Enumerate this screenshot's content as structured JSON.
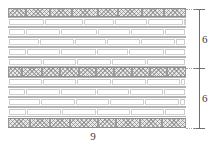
{
  "figure": {
    "type": "masonry-wall-elevation",
    "title": "",
    "wall": {
      "total_width_label": "9",
      "total_height_segments": [
        "6",
        "6"
      ]
    }
  },
  "dimensions": {
    "right": {
      "upper_segment_label": "6",
      "lower_segment_label": "6"
    },
    "bottom": {
      "width_label": "9"
    }
  },
  "courses": [
    {
      "index": 0,
      "kind": "header",
      "y": 0,
      "height": 9,
      "bricks": [
        {
          "x": 0,
          "w": 18
        },
        {
          "x": 18,
          "w": 24
        },
        {
          "x": 42,
          "w": 22
        },
        {
          "x": 64,
          "w": 26
        },
        {
          "x": 90,
          "w": 20
        },
        {
          "x": 110,
          "w": 24
        },
        {
          "x": 134,
          "w": 22
        },
        {
          "x": 156,
          "w": 22
        }
      ]
    },
    {
      "index": 1,
      "kind": "stretcher",
      "y": 9,
      "height": 10,
      "bricks": [
        {
          "x": 1,
          "w": 35
        },
        {
          "x": 37,
          "w": 38
        },
        {
          "x": 76,
          "w": 30
        },
        {
          "x": 107,
          "w": 32
        },
        {
          "x": 140,
          "w": 35
        },
        {
          "x": 176,
          "w": 2
        }
      ]
    },
    {
      "index": 2,
      "kind": "stretcher",
      "y": 19,
      "height": 10,
      "bricks": [
        {
          "x": 1,
          "w": 16
        },
        {
          "x": 18,
          "w": 34
        },
        {
          "x": 53,
          "w": 36
        },
        {
          "x": 90,
          "w": 32
        },
        {
          "x": 123,
          "w": 33
        },
        {
          "x": 157,
          "w": 20
        }
      ]
    },
    {
      "index": 3,
      "kind": "stretcher",
      "y": 29,
      "height": 10,
      "bricks": [
        {
          "x": 1,
          "w": 30
        },
        {
          "x": 32,
          "w": 34
        },
        {
          "x": 67,
          "w": 31
        },
        {
          "x": 99,
          "w": 33
        },
        {
          "x": 133,
          "w": 34
        },
        {
          "x": 168,
          "w": 9
        }
      ]
    },
    {
      "index": 4,
      "kind": "stretcher",
      "y": 39,
      "height": 10,
      "bricks": [
        {
          "x": 1,
          "w": 17
        },
        {
          "x": 19,
          "w": 33
        },
        {
          "x": 53,
          "w": 35
        },
        {
          "x": 89,
          "w": 31
        },
        {
          "x": 121,
          "w": 35
        },
        {
          "x": 157,
          "w": 20
        }
      ]
    },
    {
      "index": 5,
      "kind": "stretcher",
      "y": 49,
      "height": 10,
      "bricks": [
        {
          "x": 1,
          "w": 33
        },
        {
          "x": 35,
          "w": 33
        },
        {
          "x": 69,
          "w": 34
        },
        {
          "x": 104,
          "w": 34
        },
        {
          "x": 139,
          "w": 38
        }
      ]
    },
    {
      "index": 6,
      "kind": "header",
      "y": 59,
      "height": 10,
      "bricks": [
        {
          "x": 0,
          "w": 14
        },
        {
          "x": 14,
          "w": 20
        },
        {
          "x": 34,
          "w": 18
        },
        {
          "x": 52,
          "w": 19
        },
        {
          "x": 71,
          "w": 17
        },
        {
          "x": 88,
          "w": 18
        },
        {
          "x": 106,
          "w": 18
        },
        {
          "x": 124,
          "w": 18
        },
        {
          "x": 142,
          "w": 17
        },
        {
          "x": 159,
          "w": 19
        }
      ]
    },
    {
      "index": 7,
      "kind": "stretcher",
      "y": 69,
      "height": 10,
      "bricks": [
        {
          "x": 1,
          "w": 33
        },
        {
          "x": 35,
          "w": 33
        },
        {
          "x": 69,
          "w": 34
        },
        {
          "x": 104,
          "w": 34
        },
        {
          "x": 139,
          "w": 33
        },
        {
          "x": 173,
          "w": 4
        }
      ]
    },
    {
      "index": 8,
      "kind": "stretcher",
      "y": 79,
      "height": 10,
      "bricks": [
        {
          "x": 1,
          "w": 16
        },
        {
          "x": 18,
          "w": 34
        },
        {
          "x": 53,
          "w": 35
        },
        {
          "x": 89,
          "w": 32
        },
        {
          "x": 122,
          "w": 33
        },
        {
          "x": 156,
          "w": 21
        }
      ]
    },
    {
      "index": 9,
      "kind": "stretcher",
      "y": 89,
      "height": 10,
      "bricks": [
        {
          "x": 1,
          "w": 31
        },
        {
          "x": 33,
          "w": 34
        },
        {
          "x": 68,
          "w": 33
        },
        {
          "x": 102,
          "w": 34
        },
        {
          "x": 137,
          "w": 34
        },
        {
          "x": 172,
          "w": 5
        }
      ]
    },
    {
      "index": 10,
      "kind": "stretcher",
      "y": 99,
      "height": 10,
      "bricks": [
        {
          "x": 1,
          "w": 17
        },
        {
          "x": 19,
          "w": 34
        },
        {
          "x": 54,
          "w": 34
        },
        {
          "x": 89,
          "w": 33
        },
        {
          "x": 123,
          "w": 33
        },
        {
          "x": 157,
          "w": 20
        }
      ]
    },
    {
      "index": 11,
      "kind": "header",
      "y": 110,
      "height": 10,
      "bricks": [
        {
          "x": 0,
          "w": 22
        },
        {
          "x": 22,
          "w": 20
        },
        {
          "x": 42,
          "w": 20
        },
        {
          "x": 62,
          "w": 28
        },
        {
          "x": 90,
          "w": 18
        },
        {
          "x": 108,
          "w": 24
        },
        {
          "x": 132,
          "w": 22
        },
        {
          "x": 154,
          "w": 24
        }
      ]
    }
  ]
}
